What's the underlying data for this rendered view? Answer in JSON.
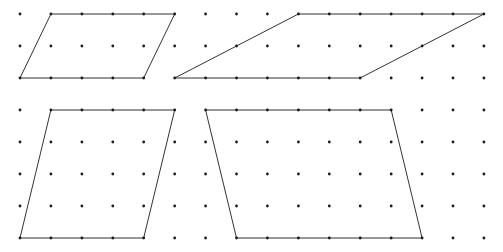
{
  "figure": {
    "type": "dot-grid-parallelograms",
    "background": "#ffffff",
    "dot_color": "#1a1a1a",
    "line_color": "#333333",
    "grid": {
      "columns": 16,
      "rows": 8,
      "origin_x": 20,
      "origin_y": 14,
      "spacing_x": 30.93,
      "spacing_y": 32,
      "dot_radius": 1.4
    },
    "shapes": [
      {
        "name": "parallelogram-top-left",
        "vertices": [
          [
            1,
            0
          ],
          [
            5,
            0
          ],
          [
            4,
            2
          ],
          [
            0,
            2
          ]
        ]
      },
      {
        "name": "parallelogram-top-right",
        "vertices": [
          [
            9,
            0
          ],
          [
            15,
            0
          ],
          [
            11,
            2
          ],
          [
            5,
            2
          ]
        ]
      },
      {
        "name": "parallelogram-bottom-left",
        "vertices": [
          [
            1,
            3
          ],
          [
            5,
            3
          ],
          [
            4,
            7
          ],
          [
            0,
            7
          ]
        ]
      },
      {
        "name": "parallelogram-bottom-right",
        "vertices": [
          [
            6,
            3
          ],
          [
            12,
            3
          ],
          [
            13,
            7
          ],
          [
            7,
            7
          ]
        ]
      }
    ]
  }
}
